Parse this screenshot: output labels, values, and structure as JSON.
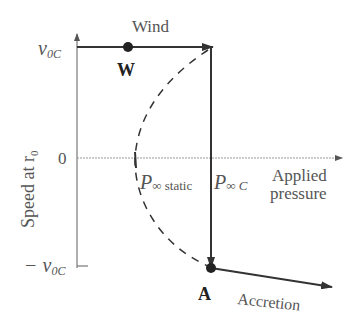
{
  "diagram": {
    "y_axis": {
      "label": "Speed at r",
      "label_subscript": "0",
      "ticks": [
        {
          "label": "v",
          "subscript": "0C",
          "position": "top"
        },
        {
          "label": "0",
          "position": "middle"
        },
        {
          "label": "− v",
          "subscript": "0C",
          "position": "bottom"
        }
      ]
    },
    "x_axis": {
      "label_line1": "Applied",
      "label_line2": "pressure",
      "markers": [
        {
          "symbol": "P",
          "subscript": "∞ static"
        },
        {
          "symbol": "P",
          "subscript": "∞ C"
        }
      ]
    },
    "points": [
      {
        "label": "W",
        "meaning": "wind"
      },
      {
        "label": "A",
        "meaning": "accretion"
      }
    ],
    "branch_labels": {
      "wind": "Wind",
      "accretion": "Accretion"
    },
    "colors": {
      "axis": "#777777",
      "curve": "#333333",
      "text": "#555555"
    }
  }
}
